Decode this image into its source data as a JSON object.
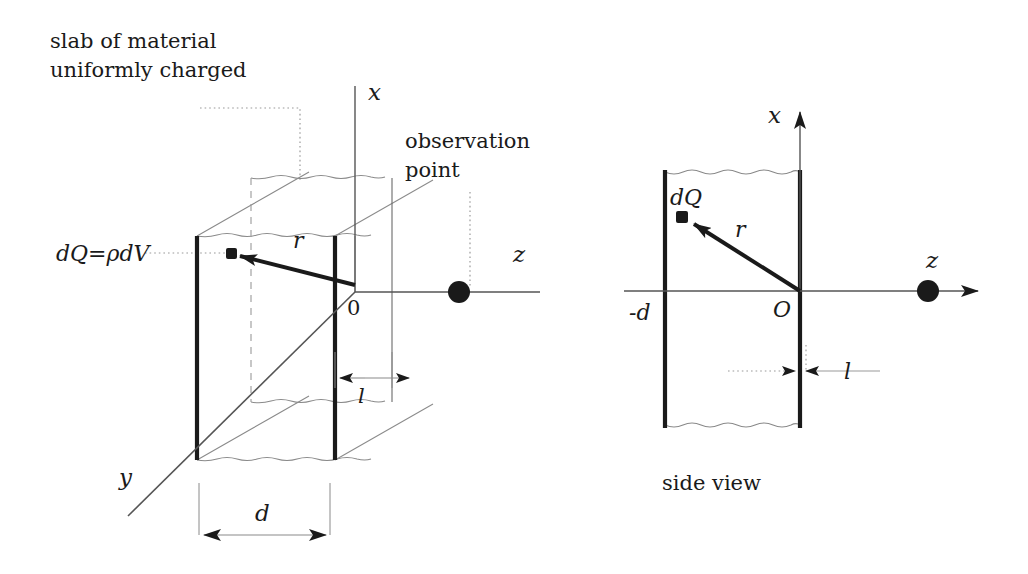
{
  "figure": {
    "caption_side_view": "side  view",
    "annotations": {
      "slab_line1": "slab of material",
      "slab_line2": "uniformly charged",
      "observation_line1": "observation",
      "observation_line2": "point",
      "charge_element": "dQ=ρdV"
    },
    "left_diagram": {
      "axis_x": "x",
      "axis_y": "y",
      "axis_z": "z",
      "origin": "0",
      "vector_r": "r",
      "dim_thickness": "l",
      "dim_depth": "d"
    },
    "right_diagram": {
      "axis_x": "x",
      "axis_z": "z",
      "origin": "O",
      "vector_r": "r",
      "charge_element": "dQ",
      "wall_left": "-d",
      "dim_thickness": "l"
    },
    "colors": {
      "ink": "#1a1a1a",
      "thin_line": "#555555",
      "wavy": "#7a7a7a",
      "dotted": "#9a9a9a"
    }
  }
}
